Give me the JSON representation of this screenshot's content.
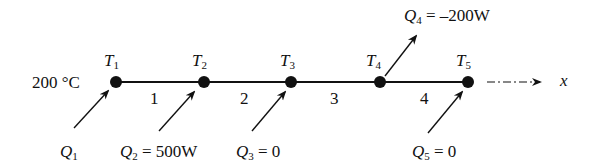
{
  "diagram": {
    "boundary_temperature": "200 °C",
    "axis_label": "x",
    "nodes": [
      {
        "name": "T",
        "sub": "1",
        "x": 116
      },
      {
        "name": "T",
        "sub": "2",
        "x": 204
      },
      {
        "name": "T",
        "sub": "3",
        "x": 291
      },
      {
        "name": "T",
        "sub": "4",
        "x": 380
      },
      {
        "name": "T",
        "sub": "5",
        "x": 468
      }
    ],
    "elements": [
      "1",
      "2",
      "3",
      "4"
    ],
    "loads": [
      {
        "name": "Q",
        "sub": "1",
        "value": "",
        "direction": "in"
      },
      {
        "name": "Q",
        "sub": "2",
        "value": "= 500W",
        "direction": "in"
      },
      {
        "name": "Q",
        "sub": "3",
        "value": "= 0",
        "direction": "in"
      },
      {
        "name": "Q",
        "sub": "4",
        "value": "= –200W",
        "direction": "out"
      },
      {
        "name": "Q",
        "sub": "5",
        "value": "= 0",
        "direction": "in"
      }
    ]
  }
}
